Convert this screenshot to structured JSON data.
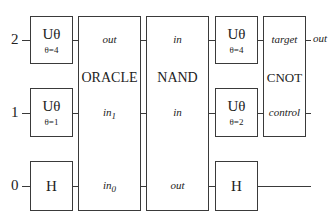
{
  "qubits": [
    {
      "index": "2",
      "label": "2"
    },
    {
      "index": "1",
      "label": "1"
    },
    {
      "index": "0",
      "label": "0"
    }
  ],
  "gates": {
    "u_q2_a": {
      "name": "Uθ",
      "param": "θ=4"
    },
    "u_q1_a": {
      "name": "Uθ",
      "param": "θ=1"
    },
    "h_q0_a": {
      "name": "H"
    },
    "oracle": {
      "name": "ORACLE",
      "ports": {
        "q2": "out",
        "q1": "in",
        "q1_sub": "1",
        "q0": "in",
        "q0_sub": "0"
      }
    },
    "nand": {
      "name": "NAND",
      "ports": {
        "q2": "in",
        "q1": "in",
        "q0": "out"
      }
    },
    "u_q2_b": {
      "name": "Uθ",
      "param": "θ=4"
    },
    "u_q1_b": {
      "name": "Uθ",
      "param": "θ=2"
    },
    "h_q0_b": {
      "name": "H"
    },
    "cnot": {
      "name": "CNOT",
      "ports": {
        "q2": "target",
        "q1": "control"
      },
      "output": "out"
    }
  }
}
